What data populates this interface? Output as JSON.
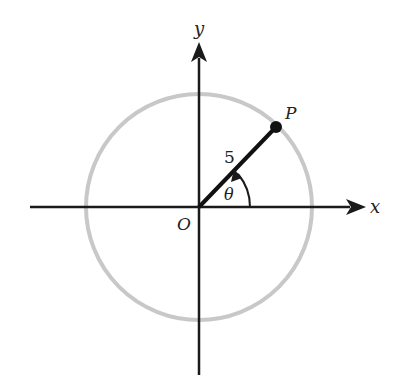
{
  "diagram": {
    "type": "unit-circle-angle",
    "labels": {
      "x_axis": "x",
      "y_axis": "y",
      "origin": "O",
      "point": "P",
      "radius": "5",
      "angle": "θ"
    },
    "colors": {
      "circle": "#c8c8c8",
      "axes": "#1a1a1a",
      "radius_line": "#111111",
      "text": "#222222"
    },
    "geometry": {
      "origin": [
        199,
        207
      ],
      "circle_radius_px": 113,
      "point_P": [
        276,
        127
      ],
      "radius_value": 5
    }
  }
}
